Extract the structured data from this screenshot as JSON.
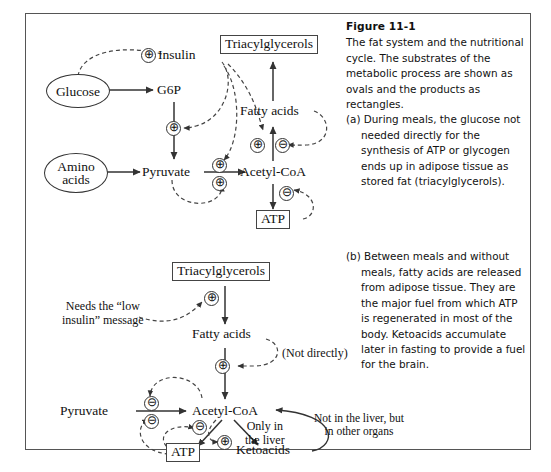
{
  "figure": {
    "title": "Figure 11-1",
    "intro": "The fat system and the nutritional cycle. The substrates of the metabolic process are shown as ovals and the products as rectangles.",
    "part_a": "(a) During meals, the glucose not needed directly for the synthesis of ATP or glycogen ends up in adipose tissue as stored fat (triacylglycerols).",
    "part_b": "(b) Between meals and without meals, fatty acids are released from adipose tissue. They are the major fuel from which ATP is regenerated in most of the body. Ketoacids accumulate later in fasting to provide a fuel for the brain."
  },
  "panel_a": {
    "glucose": "Glucose",
    "g6p": "G6P",
    "insulin": "Insulin",
    "amino_acids_line1": "Amino",
    "amino_acids_line2": "acids",
    "pyruvate": "Pyruvate",
    "acetyl_coa": "Acetyl-CoA",
    "fatty_acids": "Fatty acids",
    "triacylglycerols": "Triacylglycerols",
    "atp": "ATP",
    "signs": {
      "insulin_plus": "⊕",
      "g6p_pyruvate_plus": "⊕",
      "pyr_acoa_plus_top": "⊕",
      "pyr_acoa_plus_bottom": "⊕",
      "fatty_plus": "⊕",
      "fatty_minus": "⊖",
      "atp_minus": "⊖"
    }
  },
  "panel_b": {
    "triacylglycerols": "Triacylglycerols",
    "needs_note_line1": "Needs the “low",
    "needs_note_line2": "insulin” message",
    "fatty_acids": "Fatty acids",
    "not_directly": "(Not directly)",
    "pyruvate": "Pyruvate",
    "acetyl_coa": "Acetyl-CoA",
    "atp": "ATP",
    "ketoacids": "Ketoacids",
    "only_liver_line1": "Only in",
    "only_liver_line2": "the liver",
    "not_liver_line1": "Not in the liver, but",
    "not_liver_line2": "in other organs",
    "signs": {
      "tag_plus": "⊕",
      "fatty_plus": "⊕",
      "pyr_minus_top": "⊖",
      "pyr_minus_bottom": "⊖",
      "atp_minus": "⊖",
      "keto_plus": "⊕"
    }
  },
  "colors": {
    "frame": "#555555",
    "stroke": "#333333",
    "text": "#111111"
  }
}
